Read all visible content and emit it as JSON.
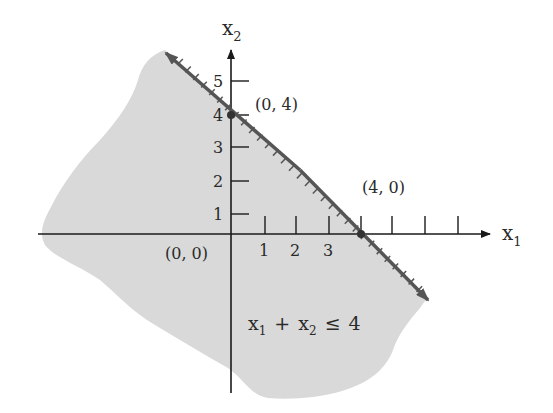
{
  "figure": {
    "type": "linear-inequality-graph",
    "inequality": {
      "lhs_var1": "x",
      "lhs_sub1": "1",
      "op_plus": "+",
      "lhs_var2": "x",
      "lhs_sub2": "2",
      "relation": "≤",
      "rhs": "4"
    },
    "axes": {
      "x_label_var": "x",
      "x_label_sub": "1",
      "y_label_var": "x",
      "y_label_sub": "2",
      "x_ticks": [
        "1",
        "2",
        "3"
      ],
      "y_ticks": [
        "1",
        "2",
        "3",
        "4",
        "5"
      ]
    },
    "points": [
      {
        "label": "(0, 0)"
      },
      {
        "label": "(0, 4)"
      },
      {
        "label": "(4, 0)"
      }
    ],
    "colors": {
      "shaded_region": "#d9d9d9",
      "boundary_line": "#555555",
      "axes": "#1a1a1a",
      "background": "#ffffff"
    }
  },
  "chart_data": {
    "type": "region",
    "title": "",
    "xlabel": "x1",
    "ylabel": "x2",
    "boundary": {
      "equation": "x1 + x2 = 4",
      "intercepts": [
        [
          0,
          4
        ],
        [
          4,
          0
        ]
      ]
    },
    "shaded": "x1 + x2 <= 4 (half-plane below/left of the line)",
    "labeled_points": [
      [
        0,
        0
      ],
      [
        0,
        4
      ],
      [
        4,
        0
      ]
    ],
    "x_ticks": [
      1,
      2,
      3,
      4,
      5,
      6,
      7
    ],
    "x_tick_labels": [
      "1",
      "2",
      "3"
    ],
    "y_ticks": [
      1,
      2,
      3,
      4,
      5
    ],
    "y_tick_labels": [
      "1",
      "2",
      "3",
      "4",
      "5"
    ],
    "grid": false,
    "legend": null
  }
}
